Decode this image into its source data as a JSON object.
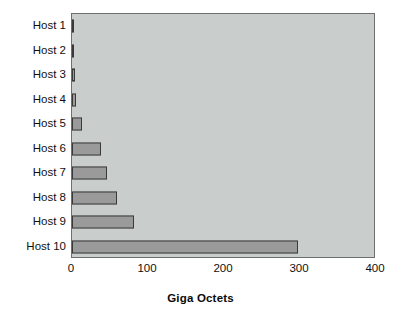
{
  "chart_data": {
    "type": "bar",
    "orientation": "horizontal",
    "title": "",
    "xlabel": "Giga Octets",
    "ylabel": "",
    "categories": [
      "Host 1",
      "Host 2",
      "Host 3",
      "Host 4",
      "Host 5",
      "Host 6",
      "Host 7",
      "Host 8",
      "Host 9",
      "Host 10"
    ],
    "values": [
      3,
      3,
      4,
      5,
      13,
      38,
      46,
      59,
      82,
      298
    ],
    "xlim": [
      0,
      400
    ],
    "xticks": [
      0,
      100,
      200,
      300,
      400
    ],
    "xtick_labels": [
      "0",
      "100",
      "200",
      "300",
      "400"
    ],
    "grid": false,
    "legend": null,
    "colors": {
      "bar_fill": "#9a9a9a",
      "bar_border": "#3a3a3a",
      "plot_background": "#c9cdcb",
      "plot_border": "#6d6f6e",
      "figure_background": "#ffffff",
      "text": "#101010"
    }
  }
}
